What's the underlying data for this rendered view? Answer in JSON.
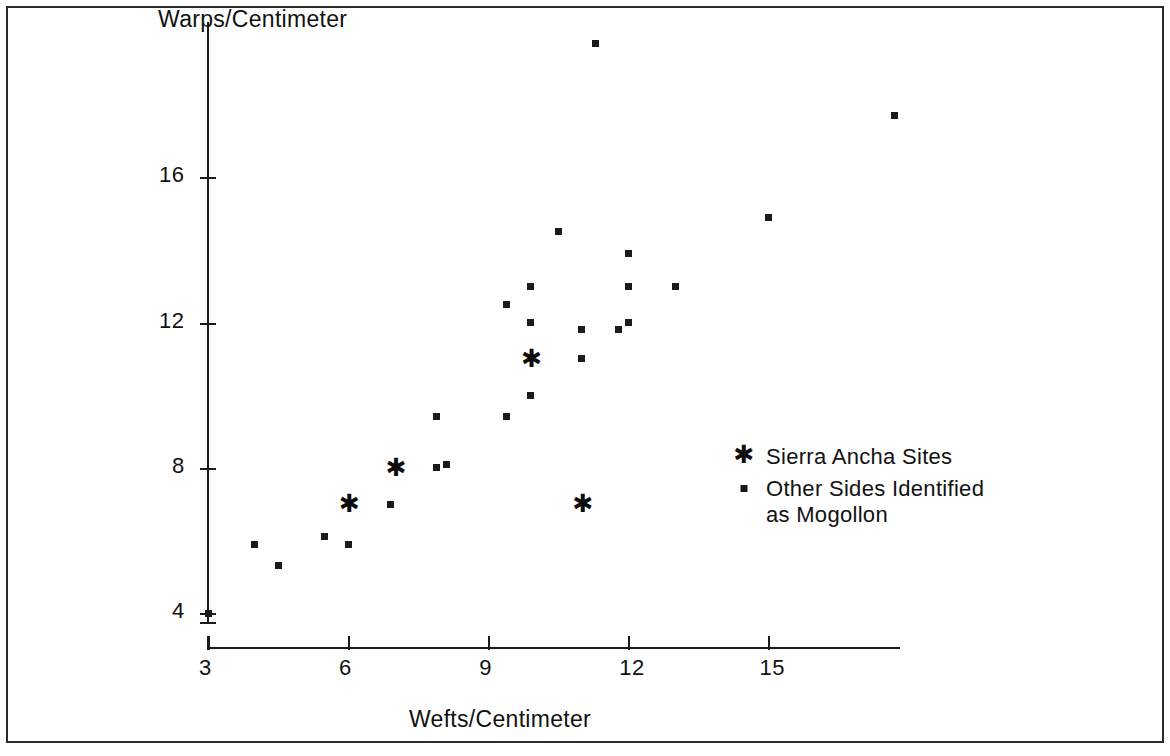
{
  "chart_data": {
    "type": "scatter",
    "title": "",
    "xlabel": "Wefts/Centimeter",
    "ylabel": "Warps/Centimeter",
    "xlim": [
      3,
      18.8
    ],
    "ylim": [
      3.6,
      20.2
    ],
    "xticks": [
      3,
      6,
      9,
      12,
      15
    ],
    "yticks": [
      4,
      8,
      12,
      16
    ],
    "xtick_labels": [
      "3",
      "6",
      "9",
      "12",
      "15"
    ],
    "ytick_labels": [
      "4",
      "8",
      "12",
      "16"
    ],
    "grid": false,
    "legend_position": "center-right",
    "series": [
      {
        "name": "Sierra Ancha Sites",
        "marker": "asterisk",
        "color": "#0c0c0c",
        "points": [
          {
            "x": 6.0,
            "y": 7.0
          },
          {
            "x": 7.0,
            "y": 8.0
          },
          {
            "x": 9.9,
            "y": 11.0
          },
          {
            "x": 11.0,
            "y": 7.0
          }
        ]
      },
      {
        "name": "Other Sides Identified as Mogollon",
        "marker": "dot",
        "color": "#1b1b1b",
        "points": [
          {
            "x": 3.0,
            "y": 4.0
          },
          {
            "x": 4.0,
            "y": 5.9
          },
          {
            "x": 4.5,
            "y": 5.3
          },
          {
            "x": 5.5,
            "y": 6.1
          },
          {
            "x": 6.0,
            "y": 5.9
          },
          {
            "x": 6.9,
            "y": 7.0
          },
          {
            "x": 7.9,
            "y": 8.0
          },
          {
            "x": 8.1,
            "y": 8.1
          },
          {
            "x": 7.9,
            "y": 9.4
          },
          {
            "x": 9.4,
            "y": 9.4
          },
          {
            "x": 9.9,
            "y": 10.0
          },
          {
            "x": 9.4,
            "y": 12.5
          },
          {
            "x": 9.9,
            "y": 13.0
          },
          {
            "x": 9.9,
            "y": 12.0
          },
          {
            "x": 11.0,
            "y": 11.0
          },
          {
            "x": 11.0,
            "y": 11.8
          },
          {
            "x": 11.8,
            "y": 11.8
          },
          {
            "x": 12.0,
            "y": 12.0
          },
          {
            "x": 12.0,
            "y": 13.0
          },
          {
            "x": 13.0,
            "y": 13.0
          },
          {
            "x": 12.0,
            "y": 13.9
          },
          {
            "x": 10.5,
            "y": 14.5
          },
          {
            "x": 15.0,
            "y": 14.9
          },
          {
            "x": 11.3,
            "y": 19.7
          },
          {
            "x": 17.7,
            "y": 17.7
          }
        ]
      }
    ]
  },
  "legend": {
    "items": [
      {
        "label": "Sierra Ancha Sites",
        "marker": "asterisk"
      },
      {
        "label": "Other Sides Identified\nas Mogollon",
        "marker": "dot"
      }
    ]
  }
}
